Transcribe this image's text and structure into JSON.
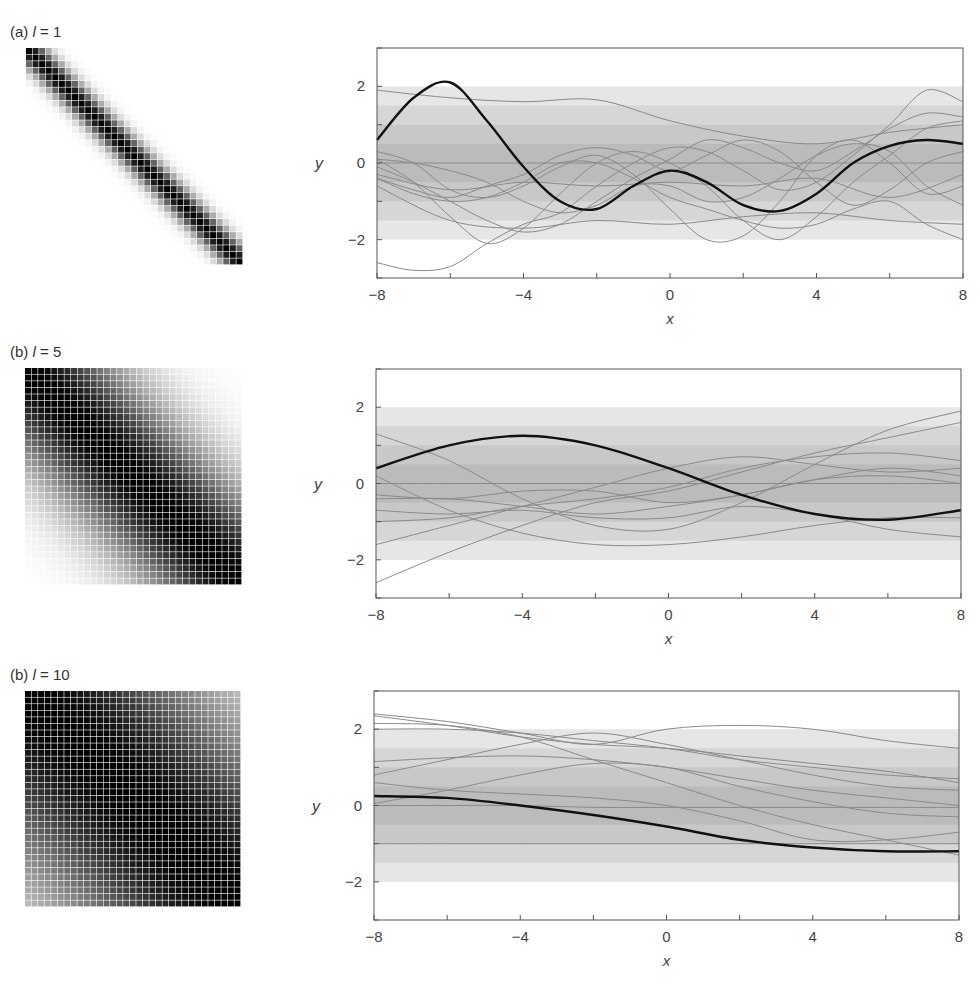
{
  "panels": [
    {
      "label_prefix": "(a) ",
      "label_var": "l",
      "label_eq": " = 1",
      "length_scale": 1,
      "heatmap": {
        "n": 33,
        "x": 26,
        "y": 48,
        "size": 217
      },
      "chart": {
        "top": 48,
        "left": 377,
        "right": 963,
        "bottom": 278
      }
    },
    {
      "label_prefix": "(b) ",
      "label_var": "l",
      "label_eq": " = 5",
      "length_scale": 5,
      "heatmap": {
        "n": 33,
        "x": 25,
        "y": 368,
        "size": 217
      },
      "chart": {
        "top": 369,
        "left": 376,
        "right": 961,
        "bottom": 598
      }
    },
    {
      "label_prefix": "(b) ",
      "label_var": "l",
      "label_eq": " = 10",
      "length_scale": 10,
      "heatmap": {
        "n": 33,
        "x": 25,
        "y": 691,
        "size": 216
      },
      "chart": {
        "top": 691,
        "left": 374,
        "right": 959,
        "bottom": 920
      }
    }
  ],
  "axes": {
    "xlabel": "x",
    "ylabel": "y",
    "xticks": [
      -8,
      -6,
      -4,
      -2,
      0,
      2,
      4,
      6,
      8
    ],
    "xtick_labels": [
      "−8",
      "",
      "−4",
      "",
      "0",
      "",
      "4",
      "",
      "8"
    ],
    "yticks": [
      -3,
      -2,
      -1,
      0,
      1,
      2,
      3
    ],
    "ytick_labels": [
      "",
      "−2",
      "",
      "0",
      "",
      "2",
      ""
    ]
  },
  "colors": {
    "band_outer": "#e6e6e6",
    "band_mid": "#d6d6d6",
    "band_inner": "#c8c8c8",
    "band_core": "#bbbbbb",
    "sample_line": "#8a8a8a",
    "highlight_line": "#111111",
    "axis": "#555555"
  },
  "chart_data": [
    {
      "type": "line",
      "title": "(a) l = 1",
      "xlabel": "x",
      "ylabel": "y",
      "xlim": [
        -8,
        8
      ],
      "ylim": [
        -3,
        3
      ],
      "bands_sigma": [
        0.5,
        1,
        1.5,
        2
      ],
      "highlight": {
        "x": [
          -8,
          -7,
          -6,
          -5,
          -4,
          -3,
          -2,
          -1,
          0,
          1,
          2,
          3,
          4,
          5,
          6,
          7,
          8
        ],
        "y": [
          0.6,
          1.7,
          2.1,
          1.1,
          -0.1,
          -1.0,
          -1.2,
          -0.6,
          -0.2,
          -0.5,
          -1.1,
          -1.25,
          -0.8,
          0.0,
          0.45,
          0.6,
          0.5
        ]
      },
      "series": [
        {
          "x": [
            -8,
            -6,
            -4,
            -2,
            0,
            2,
            4,
            6,
            8
          ],
          "y": [
            1.9,
            1.7,
            1.6,
            1.65,
            1.1,
            0.7,
            0.5,
            0.8,
            1.0
          ]
        },
        {
          "x": [
            -8,
            -6,
            -4,
            -2,
            0,
            2,
            4,
            6,
            8
          ],
          "y": [
            0.0,
            0.0,
            0.0,
            0.0,
            0.0,
            0.0,
            0.0,
            0.0,
            0.0
          ]
        },
        {
          "x": [
            -8,
            -7,
            -6,
            -5,
            -4,
            -3,
            -2,
            -1,
            0,
            1,
            2,
            3,
            4,
            5,
            6,
            7,
            8
          ],
          "y": [
            -2.6,
            -2.8,
            -2.7,
            -2.1,
            -1.6,
            -1.3,
            -0.6,
            0.0,
            0.4,
            0.3,
            -0.2,
            -0.7,
            -0.5,
            0.2,
            1.0,
            1.9,
            1.6
          ]
        },
        {
          "x": [
            -8,
            -7,
            -6,
            -5,
            -4,
            -3,
            -2,
            -1,
            0,
            1,
            2,
            3,
            4,
            5,
            6,
            7,
            8
          ],
          "y": [
            0.1,
            -0.5,
            -1.4,
            -2.1,
            -1.7,
            -0.8,
            0.0,
            0.3,
            0.0,
            -0.6,
            -1.5,
            -2.0,
            -1.4,
            -0.5,
            0.2,
            0.9,
            1.1
          ]
        },
        {
          "x": [
            -8,
            -6,
            -4,
            -2,
            0,
            2,
            4,
            6,
            8
          ],
          "y": [
            -0.6,
            -1.5,
            -1.7,
            -1.5,
            -1.6,
            -1.4,
            -1.3,
            -1.5,
            -1.6
          ]
        },
        {
          "x": [
            -8,
            -7,
            -6,
            -5,
            -4,
            -3,
            -2,
            -1,
            0,
            1,
            2,
            3,
            4,
            5,
            6,
            7,
            8
          ],
          "y": [
            0.3,
            0.0,
            -0.7,
            -0.9,
            -0.6,
            -0.1,
            0.2,
            -0.3,
            -1.2,
            -2.0,
            -1.9,
            -1.0,
            0.2,
            0.6,
            0.0,
            -0.8,
            -0.6
          ]
        },
        {
          "x": [
            -8,
            -7,
            -6,
            -5,
            -4,
            -3,
            -2,
            -1,
            0,
            1,
            2,
            3,
            4,
            5,
            6,
            7,
            8
          ],
          "y": [
            -0.4,
            -0.7,
            -0.9,
            -0.6,
            -0.3,
            0.2,
            0.4,
            0.2,
            -0.2,
            0.2,
            0.6,
            0.3,
            -0.5,
            -1.1,
            -0.7,
            0.0,
            0.3
          ]
        },
        {
          "x": [
            -8,
            -7,
            -6,
            -5,
            -4,
            -3,
            -2,
            -1,
            0,
            1,
            2,
            3,
            4,
            5,
            6,
            7,
            8
          ],
          "y": [
            -0.1,
            -0.5,
            -1.0,
            -1.5,
            -1.8,
            -1.6,
            -1.0,
            -0.4,
            0.1,
            0.6,
            0.4,
            0.0,
            -0.2,
            0.3,
            0.9,
            1.3,
            1.2
          ]
        },
        {
          "x": [
            -8,
            -6,
            -4,
            -2,
            0,
            2,
            4,
            6,
            8
          ],
          "y": [
            -0.3,
            -0.7,
            -0.5,
            -0.6,
            -0.5,
            -0.6,
            -0.4,
            -0.9,
            -0.3
          ]
        },
        {
          "x": [
            -8,
            -7,
            -6,
            -5,
            -4,
            -3,
            -2,
            -1,
            0,
            1,
            2,
            3,
            4,
            5,
            6,
            7,
            8
          ],
          "y": [
            0.1,
            0.0,
            -0.2,
            -0.5,
            -1.0,
            -1.3,
            -1.1,
            -0.6,
            -0.6,
            -1.0,
            -0.9,
            -0.4,
            0.2,
            0.5,
            0.3,
            -0.6,
            -1.1
          ]
        },
        {
          "x": [
            -8,
            -7,
            -6,
            -5,
            -4,
            -3,
            -2,
            -1,
            0,
            1,
            2,
            3,
            4,
            5,
            6,
            7,
            8
          ],
          "y": [
            -0.4,
            -0.8,
            -1.0,
            -0.9,
            -0.5,
            0.0,
            0.0,
            -0.4,
            -0.9,
            -1.2,
            -1.5,
            -1.7,
            -1.6,
            -1.2,
            -1.0,
            -1.6,
            -2.0
          ]
        }
      ]
    },
    {
      "type": "line",
      "title": "(b) l = 5",
      "xlabel": "x",
      "ylabel": "y",
      "xlim": [
        -8,
        8
      ],
      "ylim": [
        -3,
        3
      ],
      "bands_sigma": [
        0.5,
        1,
        1.5,
        2
      ],
      "highlight": {
        "x": [
          -8,
          -6,
          -4,
          -2,
          0,
          2,
          4,
          6,
          8
        ],
        "y": [
          0.4,
          1.0,
          1.25,
          1.0,
          0.4,
          -0.3,
          -0.8,
          -0.95,
          -0.7
        ]
      },
      "series": [
        {
          "x": [
            -8,
            -6,
            -4,
            -2,
            0,
            2,
            4,
            6,
            8
          ],
          "y": [
            0.0,
            0.0,
            0.0,
            0.0,
            0.0,
            0.0,
            0.0,
            0.0,
            0.0
          ]
        },
        {
          "x": [
            -8,
            -6,
            -4,
            -2,
            0,
            2,
            4,
            6,
            8
          ],
          "y": [
            1.3,
            0.6,
            -0.4,
            -1.1,
            -1.2,
            -0.5,
            0.5,
            1.4,
            1.9
          ]
        },
        {
          "x": [
            -8,
            -6,
            -4,
            -2,
            0,
            2,
            4,
            6,
            8
          ],
          "y": [
            -2.6,
            -1.8,
            -1.1,
            -0.5,
            -0.2,
            0.3,
            0.8,
            1.2,
            1.6
          ]
        },
        {
          "x": [
            -8,
            -6,
            -4,
            -2,
            0,
            2,
            4,
            6,
            8
          ],
          "y": [
            -1.6,
            -1.1,
            -0.6,
            -0.1,
            0.4,
            0.7,
            0.5,
            0.3,
            0.4
          ]
        },
        {
          "x": [
            -8,
            -6,
            -4,
            -2,
            0,
            2,
            4,
            6,
            8
          ],
          "y": [
            0.2,
            -0.7,
            -1.3,
            -1.6,
            -1.6,
            -1.4,
            -1.1,
            -0.9,
            -0.9
          ]
        },
        {
          "x": [
            -8,
            -6,
            -4,
            -2,
            0,
            2,
            4,
            6,
            8
          ],
          "y": [
            -0.4,
            -0.4,
            -0.6,
            -0.8,
            -0.6,
            -0.3,
            0.1,
            0.4,
            0.2
          ]
        },
        {
          "x": [
            -8,
            -6,
            -4,
            -2,
            0,
            2,
            4,
            6,
            8
          ],
          "y": [
            -0.7,
            -0.8,
            -0.7,
            -0.9,
            -0.9,
            -0.6,
            -0.8,
            -1.2,
            -1.4
          ]
        },
        {
          "x": [
            -8,
            -6,
            -4,
            -2,
            0,
            2,
            4,
            6,
            8
          ],
          "y": [
            -1.0,
            -0.9,
            -0.6,
            -0.4,
            -0.1,
            0.4,
            0.7,
            0.8,
            0.6
          ]
        },
        {
          "x": [
            -8,
            -6,
            -4,
            -2,
            0,
            2,
            4,
            6,
            8
          ],
          "y": [
            -0.3,
            -0.4,
            -0.2,
            -0.2,
            -0.5,
            -0.3,
            0.1,
            0.2,
            0.0
          ]
        }
      ]
    },
    {
      "type": "line",
      "title": "(b) l = 10",
      "xlabel": "x",
      "ylabel": "y",
      "xlim": [
        -8,
        8
      ],
      "ylim": [
        -3,
        3
      ],
      "bands_sigma": [
        0.5,
        1,
        1.5,
        2
      ],
      "highlight": {
        "x": [
          -8,
          -6,
          -4,
          -2,
          0,
          2,
          4,
          6,
          8
        ],
        "y": [
          0.25,
          0.2,
          0.0,
          -0.25,
          -0.55,
          -0.9,
          -1.1,
          -1.2,
          -1.2
        ]
      },
      "series": [
        {
          "x": [
            -8,
            -6,
            -4,
            -2,
            0,
            2,
            4,
            6,
            8
          ],
          "y": [
            2.4,
            2.2,
            1.9,
            1.6,
            2.0,
            2.1,
            2.0,
            1.7,
            1.5
          ]
        },
        {
          "x": [
            -8,
            -6,
            -4,
            -2,
            0,
            2,
            4,
            6,
            8
          ],
          "y": [
            2.35,
            2.1,
            1.8,
            1.6,
            1.5,
            1.3,
            1.1,
            0.9,
            0.6
          ]
        },
        {
          "x": [
            -8,
            -6,
            -4,
            -2,
            0,
            2,
            4,
            6,
            8
          ],
          "y": [
            2.15,
            2.1,
            1.8,
            1.2,
            0.6,
            0.0,
            -0.5,
            -0.9,
            -1.3
          ]
        },
        {
          "x": [
            -8,
            -6,
            -4,
            -2,
            0,
            2,
            4,
            6,
            8
          ],
          "y": [
            2.0,
            2.0,
            1.9,
            1.7,
            1.5,
            1.2,
            1.0,
            0.8,
            0.7
          ]
        },
        {
          "x": [
            -8,
            -6,
            -4,
            -2,
            0,
            2,
            4,
            6,
            8
          ],
          "y": [
            0.8,
            1.2,
            1.6,
            1.9,
            1.6,
            1.2,
            0.8,
            0.5,
            0.4
          ]
        },
        {
          "x": [
            -8,
            -6,
            -4,
            -2,
            0,
            2,
            4,
            6,
            8
          ],
          "y": [
            1.15,
            1.25,
            1.3,
            1.2,
            1.0,
            0.7,
            0.4,
            0.2,
            0.0
          ]
        },
        {
          "x": [
            -8,
            -6,
            -4,
            -2,
            0,
            2,
            4,
            6,
            8
          ],
          "y": [
            0.05,
            0.4,
            0.8,
            1.1,
            1.0,
            0.5,
            0.1,
            -0.2,
            -0.3
          ]
        },
        {
          "x": [
            -8,
            -6,
            -4,
            -2,
            0,
            2,
            4,
            6,
            8
          ],
          "y": [
            0.6,
            0.4,
            0.3,
            0.2,
            0.0,
            -0.4,
            -0.9,
            -0.9,
            -0.7
          ]
        },
        {
          "x": [
            -8,
            -6,
            -4,
            -2,
            0,
            2,
            4,
            6,
            8
          ],
          "y": [
            0.0,
            0.0,
            0.0,
            -0.05,
            -0.05,
            -0.05,
            -0.05,
            -0.05,
            -0.05
          ]
        },
        {
          "x": [
            -8,
            -6,
            -4,
            -2,
            0,
            2,
            4,
            6,
            8
          ],
          "y": [
            -1.0,
            -1.0,
            -1.0,
            -1.0,
            -1.0,
            -1.0,
            -1.0,
            -1.0,
            -1.0
          ]
        }
      ]
    }
  ]
}
